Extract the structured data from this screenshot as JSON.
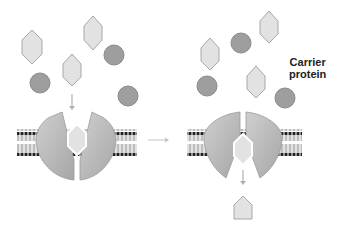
{
  "diagram": {
    "label": {
      "line1": "Carrier",
      "line2": "protein"
    },
    "colors": {
      "hexagon_fill": "#e2e2e2",
      "hexagon_stroke": "#a8a8a8",
      "circle_fill": "#9e9e9e",
      "circle_stroke": "#8a8a8a",
      "protein_fill": "#b8b8b8",
      "arrow": "#b0b0b0",
      "lipid_head": "#222222"
    },
    "panels": [
      {
        "name": "before",
        "state": "carrier open to outside, solute bound"
      },
      {
        "name": "after",
        "state": "carrier open to inside, solute released"
      }
    ]
  }
}
